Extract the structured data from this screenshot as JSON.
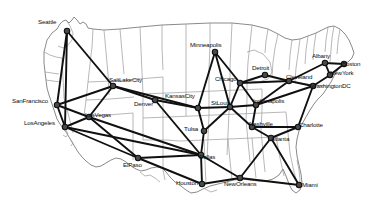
{
  "figure": {
    "kind": "network-topology-map",
    "region": "United States",
    "background_color": "#ffffff",
    "node_color": "#4a4a4a",
    "edge_color": "#101010",
    "geography_color": "#9a9a9a"
  },
  "nodes": [
    {
      "id": "Seattle",
      "label": "Seattle",
      "x": 67,
      "y": 31,
      "lx": 38,
      "ly": 22
    },
    {
      "id": "SanFrancisco",
      "label": "SanFrancisco",
      "x": 57,
      "y": 105,
      "lx": 12,
      "ly": 101
    },
    {
      "id": "LosAngeles",
      "label": "LosAngeles",
      "x": 65,
      "y": 127,
      "lx": 24,
      "ly": 123
    },
    {
      "id": "LasVegas",
      "label": "LasVegas",
      "x": 89,
      "y": 117,
      "lx": 85,
      "ly": 115
    },
    {
      "id": "SaltLakeCity",
      "label": "SaltLakeCity",
      "x": 113,
      "y": 86,
      "lx": 109,
      "ly": 80
    },
    {
      "id": "Denver",
      "label": "Denver",
      "x": 155,
      "y": 100,
      "lx": 134,
      "ly": 104
    },
    {
      "id": "ElPaso",
      "label": "ElPaso",
      "x": 138,
      "y": 158,
      "lx": 123,
      "ly": 165
    },
    {
      "id": "KansasCity",
      "label": "KansasCity",
      "x": 198,
      "y": 108,
      "lx": 165,
      "ly": 96
    },
    {
      "id": "Tulsa",
      "label": "Tulsa",
      "x": 204,
      "y": 131,
      "lx": 184,
      "ly": 129
    },
    {
      "id": "Dallas",
      "label": "Dallas",
      "x": 201,
      "y": 155,
      "lx": 199,
      "ly": 157
    },
    {
      "id": "Houston",
      "label": "Houston",
      "x": 202,
      "y": 184,
      "lx": 176,
      "ly": 183
    },
    {
      "id": "NewOrleans",
      "label": "NewOrleans",
      "x": 240,
      "y": 178,
      "lx": 224,
      "ly": 184
    },
    {
      "id": "Minneapolis",
      "label": "Minneapolis",
      "x": 215,
      "y": 52,
      "lx": 190,
      "ly": 45
    },
    {
      "id": "StLouis",
      "label": "StLouis",
      "x": 230,
      "y": 107,
      "lx": 211,
      "ly": 103
    },
    {
      "id": "Chicago",
      "label": "Chicago",
      "x": 240,
      "y": 83,
      "lx": 215,
      "ly": 79
    },
    {
      "id": "Detroit",
      "label": "Detroit",
      "x": 265,
      "y": 75,
      "lx": 252,
      "ly": 68
    },
    {
      "id": "Indianapolis",
      "label": "Indianapolis",
      "x": 256,
      "y": 105,
      "lx": 253,
      "ly": 101
    },
    {
      "id": "Nashville",
      "label": "Nashville",
      "x": 252,
      "y": 127,
      "lx": 249,
      "ly": 124
    },
    {
      "id": "Atlanta",
      "label": "Atlanta",
      "x": 271,
      "y": 138,
      "lx": 271,
      "ly": 139
    },
    {
      "id": "Miami",
      "label": "Miami",
      "x": 299,
      "y": 185,
      "lx": 302,
      "ly": 185
    },
    {
      "id": "Charlotte",
      "label": "Charlotte",
      "x": 298,
      "y": 127,
      "lx": 299,
      "ly": 125
    },
    {
      "id": "Cleveland",
      "label": "Cleveland",
      "x": 289,
      "y": 81,
      "lx": 286,
      "ly": 77
    },
    {
      "id": "WashingtonDC",
      "label": "WashingtonDC",
      "x": 313,
      "y": 86,
      "lx": 311,
      "ly": 86
    },
    {
      "id": "Albany",
      "label": "Albany",
      "x": 325,
      "y": 63,
      "lx": 312,
      "ly": 56
    },
    {
      "id": "NewYork",
      "label": "NewYork",
      "x": 330,
      "y": 75,
      "lx": 330,
      "ly": 73
    },
    {
      "id": "Boston",
      "label": "Boston",
      "x": 344,
      "y": 64,
      "lx": 342,
      "ly": 64
    }
  ],
  "edges": [
    [
      "Seattle",
      "SanFrancisco"
    ],
    [
      "Seattle",
      "SaltLakeCity"
    ],
    [
      "Seattle",
      "LosAngeles"
    ],
    [
      "SanFrancisco",
      "LosAngeles"
    ],
    [
      "SanFrancisco",
      "SaltLakeCity"
    ],
    [
      "SanFrancisco",
      "LasVegas"
    ],
    [
      "LosAngeles",
      "LasVegas"
    ],
    [
      "LosAngeles",
      "ElPaso"
    ],
    [
      "LosAngeles",
      "Dallas"
    ],
    [
      "LasVegas",
      "SaltLakeCity"
    ],
    [
      "LasVegas",
      "ElPaso"
    ],
    [
      "LasVegas",
      "Dallas"
    ],
    [
      "SaltLakeCity",
      "Denver"
    ],
    [
      "SaltLakeCity",
      "KansasCity"
    ],
    [
      "Denver",
      "KansasCity"
    ],
    [
      "Denver",
      "Dallas"
    ],
    [
      "ElPaso",
      "Dallas"
    ],
    [
      "ElPaso",
      "Houston"
    ],
    [
      "KansasCity",
      "Minneapolis"
    ],
    [
      "KansasCity",
      "StLouis"
    ],
    [
      "KansasCity",
      "Tulsa"
    ],
    [
      "Tulsa",
      "Dallas"
    ],
    [
      "Tulsa",
      "StLouis"
    ],
    [
      "Dallas",
      "Houston"
    ],
    [
      "Dallas",
      "NewOrleans"
    ],
    [
      "Houston",
      "NewOrleans"
    ],
    [
      "NewOrleans",
      "Atlanta"
    ],
    [
      "NewOrleans",
      "Miami"
    ],
    [
      "Minneapolis",
      "Chicago"
    ],
    [
      "Minneapolis",
      "StLouis"
    ],
    [
      "StLouis",
      "Chicago"
    ],
    [
      "StLouis",
      "Indianapolis"
    ],
    [
      "StLouis",
      "Nashville"
    ],
    [
      "Chicago",
      "Detroit"
    ],
    [
      "Chicago",
      "Indianapolis"
    ],
    [
      "Chicago",
      "Cleveland"
    ],
    [
      "Detroit",
      "Cleveland"
    ],
    [
      "Indianapolis",
      "Nashville"
    ],
    [
      "Indianapolis",
      "Cleveland"
    ],
    [
      "Indianapolis",
      "WashingtonDC"
    ],
    [
      "Nashville",
      "Atlanta"
    ],
    [
      "Nashville",
      "Charlotte"
    ],
    [
      "Atlanta",
      "Charlotte"
    ],
    [
      "Atlanta",
      "Miami"
    ],
    [
      "Charlotte",
      "WashingtonDC"
    ],
    [
      "Cleveland",
      "Albany"
    ],
    [
      "Cleveland",
      "WashingtonDC"
    ],
    [
      "WashingtonDC",
      "NewYork"
    ],
    [
      "Albany",
      "NewYork"
    ],
    [
      "Albany",
      "Boston"
    ],
    [
      "NewYork",
      "Boston"
    ]
  ],
  "geography": {
    "outline": "M44,52 L47,40 L52,33 L57,29 L60,24 L63,21 L66,20 L69,23 L72,20 L74,17 L77,20 L80,24 L83,22 L86,24 L88,28 L93,29 L104,30 L120,29 L140,27 L162,25 L186,24 L210,23 L232,23 L252,25 L268,29 L278,34 L285,38 L292,40 L300,39 L308,36 L316,33 L322,30 L328,27 L334,26 L340,29 L345,34 L349,40 L352,47 L354,53 L352,58 L348,62 L344,64 L340,67 L337,71 L334,76 L331,82 L327,88 L323,94 L318,99 L314,104 L310,110 L306,117 L302,124 L299,131 L297,139 L296,147 L297,156 L299,165 L301,174 L302,183 L300,190 L296,193 L292,190 L289,184 L286,176 L283,169 L279,175 L273,179 L266,181 L258,181 L250,180 L242,179 L234,180 L226,182 L218,184 L210,186 L203,189 L197,192 L191,193 L186,190 L181,186 L175,182 L170,177 L166,172 L162,168 L157,167 L151,168 L146,170 L141,171 L136,169 L131,166 L126,162 L121,159 L116,158 L111,160 L106,163 L101,166 L96,167 L91,165 L86,161 L82,157 L78,152 L75,147 L72,142 L69,137 L66,132 L63,128 L60,124 L57,119 L55,113 L53,107 L51,101 L49,95 L47,88 L46,80 L45,72 L44,63 Z",
    "interior": [
      "M93,29 L92,47 L90,64 L88,82 L86,100 L84,116",
      "M88,82 L113,81 L138,79 L163,77",
      "M86,100 L110,99 L134,97",
      "M84,116 L108,115 L133,113 L133,140 L133,160",
      "M104,30 L106,52 L108,74 L109,95",
      "M120,29 L122,52 L124,74",
      "M140,27 L141,50 L142,72 L143,94 L143,118 L143,140",
      "M163,77 L163,100 L163,122 L163,146",
      "M162,25 L162,48 L163,70",
      "M186,24 L186,47 L186,69",
      "M210,23 L210,46 L209,68",
      "M232,23 L231,45 L230,66",
      "M143,94 L167,93 L191,92 L214,91",
      "M143,118 L168,117 L192,116 L214,115",
      "M143,140 L167,140 L180,141",
      "M163,146 L163,170 L165,180",
      "M186,69 L186,92 L186,116",
      "M209,68 L209,91 L209,115 L208,138 L207,160",
      "M230,66 L230,90 L229,112 L228,134 L227,155",
      "M214,91 L238,90 L262,89",
      "M214,115 L238,114 L262,113 L286,112",
      "M180,141 L204,140 L228,139 L252,138 L276,137",
      "M252,25 L250,44 L248,62 L247,80",
      "M247,80 L259,82 L268,79 L272,72 L270,62 L263,54 L254,50 L247,52",
      "M268,29 L266,41 L265,53",
      "M247,80 L247,100 L246,120",
      "M262,89 L262,110 L261,131",
      "M278,34 L275,48 L273,62 L272,76",
      "M286,112 L288,133 L290,153",
      "M292,40 L290,55 L289,70",
      "M300,39 L298,54 L296,68 L295,82",
      "M308,36 L306,50 L305,64",
      "M316,33 L314,47 L313,60",
      "M328,27 L326,40 L325,52",
      "M295,82 L305,84 L315,85 L325,86",
      "M276,137 L280,158 L284,176",
      "M252,138 L254,160 L256,178",
      "M228,139 L230,161 L232,179",
      "M204,140 L205,162 L206,184",
      "M290,153 L294,172 L298,186",
      "M261,131 L263,152 L265,172",
      "M246,120 L248,141 L250,162",
      "M334,26 L332,38 L331,50 L330,62",
      "M340,29 L338,42 L337,54",
      "M66,20 L70,26 L73,33 L72,40 L68,45 L63,48 L58,46",
      "M44,52 L50,55 L56,57 L62,58",
      "M62,58 L63,78 L64,98",
      "M64,98 L69,117 L73,133",
      "M45,72 L52,73 L59,74",
      "M46,80 L53,81 L60,82"
    ],
    "coast_detail": [
      "M66,130 L68,134 L66,137 L63,135",
      "M70,139 L73,143 L71,146",
      "M140,172 L145,176 L150,175 L155,178 L160,182",
      "M205,189 L211,192 L217,190",
      "M297,160 L299,170 L300,180 L299,188"
    ]
  }
}
